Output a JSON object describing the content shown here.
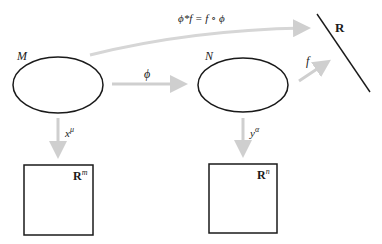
{
  "diagram": {
    "colors": {
      "stroke": "#1a1a1a",
      "arrow": "#cfcfcf",
      "background": "#ffffff"
    },
    "nodes": {
      "M": {
        "label": "M"
      },
      "N": {
        "label": "N"
      },
      "R": {
        "label": "R"
      },
      "Rm": {
        "label": "R",
        "superscript": "m"
      },
      "Rn": {
        "label": "R",
        "superscript": "n"
      }
    },
    "arrows": {
      "phi": {
        "label": "ϕ",
        "from": "M",
        "to": "N"
      },
      "f": {
        "label": "f",
        "from": "N",
        "to": "R"
      },
      "pullback": {
        "label": "ϕ*f = f ∘ ϕ",
        "from": "M",
        "to": "R"
      },
      "x_mu": {
        "label": "x",
        "superscript": "μ",
        "from": "M",
        "to": "Rm"
      },
      "y_alpha": {
        "label": "y",
        "superscript": "α",
        "from": "N",
        "to": "Rn"
      }
    }
  }
}
